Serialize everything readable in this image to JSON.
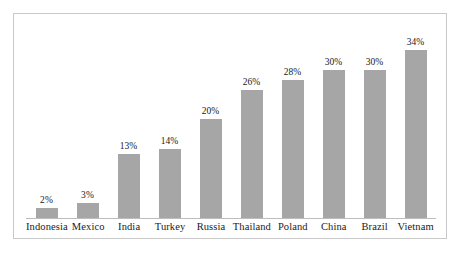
{
  "chart_data": {
    "type": "bar",
    "title": "",
    "subtitle": "",
    "xlabel": "",
    "ylabel": "",
    "ylim": [
      0,
      34
    ],
    "grid": false,
    "legend": false,
    "value_suffix": "%",
    "bar_color": "#a6a6a6",
    "frame_color": "#c9c9c9",
    "axis_color": "#bdbdbd",
    "text_color": "#1a1a1a",
    "categories": [
      "Indonesia",
      "Mexico",
      "India",
      "Turkey",
      "Russia",
      "Thailand",
      "Poland",
      "China",
      "Brazil",
      "Vietnam"
    ],
    "values": [
      2,
      3,
      13,
      14,
      20,
      26,
      28,
      30,
      30,
      34
    ],
    "value_labels": [
      "2%",
      "3%",
      "13%",
      "14%",
      "20%",
      "26%",
      "28%",
      "30%",
      "30%",
      "34%"
    ],
    "points": [
      {
        "category": "Indonesia",
        "value": 2,
        "label": "2%"
      },
      {
        "category": "Mexico",
        "value": 3,
        "label": "3%"
      },
      {
        "category": "India",
        "value": 13,
        "label": "13%"
      },
      {
        "category": "Turkey",
        "value": 14,
        "label": "14%"
      },
      {
        "category": "Russia",
        "value": 20,
        "label": "20%"
      },
      {
        "category": "Thailand",
        "value": 26,
        "label": "26%"
      },
      {
        "category": "Poland",
        "value": 28,
        "label": "28%"
      },
      {
        "category": "China",
        "value": 30,
        "label": "30%"
      },
      {
        "category": "Brazil",
        "value": 30,
        "label": "30%"
      },
      {
        "category": "Vietnam",
        "value": 34,
        "label": "34%"
      }
    ]
  }
}
